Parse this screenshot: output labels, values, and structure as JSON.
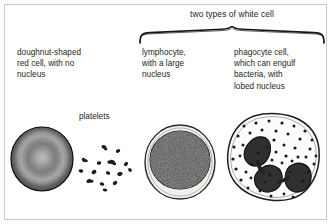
{
  "figure": {
    "background_color": "#ffffff",
    "border_color": "#c8c8c8",
    "ink_color": "#231f20"
  },
  "brace": {
    "label": "two types of white cell",
    "spans": [
      "lymphocyte",
      "phagocyte cell"
    ]
  },
  "captions": {
    "red_cell": "doughnut-shaped\nred cell, with no\nnucleus",
    "lymphocyte": "lymphocyte,\nwith a large\nnucleus",
    "phagocyte": "phagocyte cell,\nwhich can engulf\nbacteria, with\nlobed nucleus",
    "platelets": "platelets"
  },
  "figures": {
    "red_cell": {
      "name": "red blood cell",
      "shape": "circle",
      "description": "doughnut-shaped biconcave disc, dark rim with pale centre",
      "rim_color": "#1a1a1a",
      "mid_color": "#bfbfbf",
      "inner_color": "#6e6e6e",
      "centre_color": "#efefef"
    },
    "platelets": {
      "name": "platelets",
      "shape": "scattered small dark fragments",
      "count": 15,
      "color": "#1c1c1c",
      "points": [
        [
          30,
          9
        ],
        [
          44,
          13
        ],
        [
          10,
          22
        ],
        [
          25,
          25
        ],
        [
          38,
          24
        ],
        [
          50,
          26
        ],
        [
          7,
          33
        ],
        [
          20,
          33
        ],
        [
          34,
          35
        ],
        [
          46,
          36
        ],
        [
          55,
          32
        ],
        [
          15,
          42
        ],
        [
          27,
          45
        ],
        [
          40,
          45
        ],
        [
          31,
          51
        ]
      ]
    },
    "lymphocyte": {
      "name": "lymphocyte",
      "shape": "circle",
      "description": "pale cytoplasm rim around a very large dark granular nucleus",
      "cytoplasm_color": "#efefec",
      "outline_color": "#2b2b2b",
      "nucleus_color": "#2a2a2a"
    },
    "phagocyte": {
      "name": "phagocyte cell",
      "shape": "irregular blob",
      "description": "lobed dark nucleus (3 lobes) in granular speckled cytoplasm",
      "cytoplasm_color": "#fcfcfa",
      "outline_color": "#1e1e1e",
      "nucleus_color": "#2b2b2b",
      "granule_color": "#1a1a1a",
      "nucleus_lobes": 3
    }
  }
}
